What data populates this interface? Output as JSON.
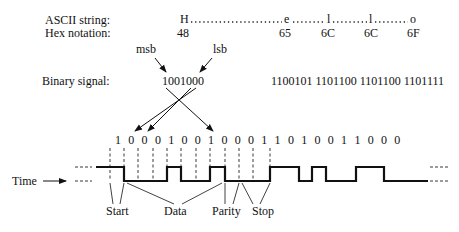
{
  "labels": {
    "ascii_string": "ASCII string:",
    "hex_notation": "Hex notation:",
    "binary_signal": "Binary signal:",
    "time": "Time",
    "msb": "msb",
    "lsb": "lsb",
    "start": "Start",
    "data": "Data",
    "parity": "Parity",
    "stop": "Stop"
  },
  "ascii": {
    "chars": [
      "H",
      "e",
      "l",
      "l",
      "o"
    ],
    "hex": [
      "48",
      "65",
      "6C",
      "6C",
      "6F"
    ]
  },
  "binary": {
    "first": "1001000",
    "rest": "1100101 1101100 1101100 1101111"
  },
  "bit_row": "1 0 0 0 1 0 0 1 0 0 0 1 1 0 1 0 0 1 1 0 0 0"
}
